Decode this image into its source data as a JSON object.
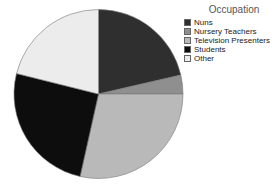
{
  "chart_data": {
    "type": "pie",
    "title": "",
    "legend_title": "Occupation",
    "legend_position": "right",
    "categories": [
      "Nuns",
      "Nursery Teachers",
      "Television Presenters",
      "Students",
      "Other"
    ],
    "values": [
      21.4,
      3.6,
      28.5,
      25.4,
      21.1
    ],
    "colors": [
      "#2f2f2f",
      "#8f8f8f",
      "#b9b9b9",
      "#0d0d0d",
      "#ececec"
    ],
    "start_angle_deg": -90,
    "direction": "clockwise"
  },
  "legend": {
    "title": "Occupation",
    "items": [
      {
        "label": "Nuns",
        "color": "#2f2f2f"
      },
      {
        "label": "Nursery Teachers",
        "color": "#8f8f8f"
      },
      {
        "label": "Television Presenters",
        "color": "#b9b9b9"
      },
      {
        "label": "Students",
        "color": "#0d0d0d"
      },
      {
        "label": "Other",
        "color": "#ececec"
      }
    ]
  }
}
